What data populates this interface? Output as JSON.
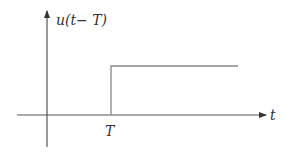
{
  "diagram": {
    "y_axis_label": "u(t− T)",
    "x_axis_label": "t",
    "step_label": "T",
    "colors": {
      "axis": "#555555",
      "signal": "#888888",
      "text": "#333333"
    }
  }
}
